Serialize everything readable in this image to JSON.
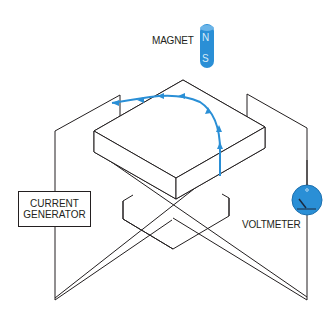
{
  "diagram": {
    "type": "hall-effect-apparatus",
    "labels": {
      "magnet": "MAGNET",
      "magnet_north": "N",
      "magnet_south": "S",
      "current_generator_line1": "CURRENT",
      "current_generator_line2": "GENERATOR",
      "voltmeter": "VOLTMETER"
    },
    "colors": {
      "accent_blue": "#2a8fd6",
      "line": "#231f20",
      "background": "#ffffff"
    },
    "components": [
      {
        "id": "magnet",
        "label": "MAGNET",
        "poles": [
          "N",
          "S"
        ]
      },
      {
        "id": "conductor-slab",
        "label": ""
      },
      {
        "id": "current-generator",
        "label": "CURRENT GENERATOR"
      },
      {
        "id": "voltmeter",
        "label": "VOLTMETER"
      },
      {
        "id": "charge-path",
        "label": "",
        "description": "curved arrow path of deflected charge carriers"
      }
    ]
  }
}
